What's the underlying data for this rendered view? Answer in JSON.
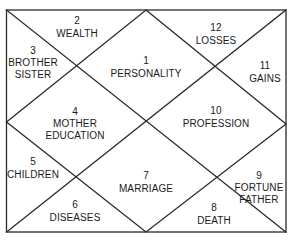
{
  "diagram": {
    "type": "north-indian-astrology-chart",
    "line_color": "#2a2a2a",
    "text_color": "#1a1a1a",
    "houses": [
      {
        "number": "1",
        "label": "PERSONALITY",
        "label2": ""
      },
      {
        "number": "2",
        "label": "WEALTH",
        "label2": ""
      },
      {
        "number": "3",
        "label": "BROTHER",
        "label2": "SISTER"
      },
      {
        "number": "4",
        "label": "MOTHER",
        "label2": "EDUCATION"
      },
      {
        "number": "5",
        "label": "CHILDREN",
        "label2": ""
      },
      {
        "number": "6",
        "label": "DISEASES",
        "label2": ""
      },
      {
        "number": "7",
        "label": "MARRIAGE",
        "label2": ""
      },
      {
        "number": "8",
        "label": "DEATH",
        "label2": ""
      },
      {
        "number": "9",
        "label": "FORTUNE",
        "label2": "FATHER"
      },
      {
        "number": "10",
        "label": "PROFESSION",
        "label2": ""
      },
      {
        "number": "11",
        "label": "GAINS",
        "label2": ""
      },
      {
        "number": "12",
        "label": "LOSSES",
        "label2": ""
      }
    ]
  }
}
